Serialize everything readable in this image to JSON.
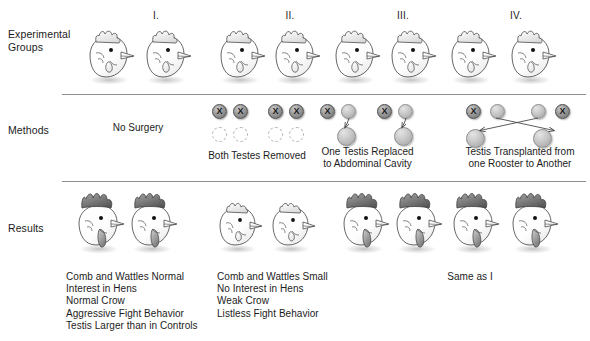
{
  "figure": {
    "background_color": "#ffffff",
    "line_color": "#8d8d8d"
  },
  "row_labels": {
    "experimental_groups": "Experimental\nGroups",
    "methods": "Methods",
    "results": "Results"
  },
  "groups": [
    {
      "numeral": "I.",
      "method_caption": "No Surgery",
      "result_text": "Comb and Wattles Normal\nInterest in Hens\nNormal Crow\nAggressive Fight Behavior\nTestis Larger than in Controls"
    },
    {
      "numeral": "II.",
      "method_caption": "Both Testes Removed",
      "result_text": "Comb and Wattles Small\nNo Interest in Hens\nWeak Crow\nListless Fight Behavior"
    },
    {
      "numeral": "III.",
      "method_caption": "One Testis Replaced\nto Abdominal Cavity",
      "result_text": ""
    },
    {
      "numeral": "IV.",
      "method_caption": "Testis Transplanted from\none Rooster to Another",
      "result_text": "Same as I"
    }
  ],
  "shared_result_note": "Same as I",
  "symbols": {
    "removed_testis_mark": "X",
    "removed_testis_name": "testis-removed-marker",
    "transplanted_testis_name": "testis-transplanted",
    "absent_testis_name": "testis-absent-outline"
  },
  "colors": {
    "text": "#1c1c1c",
    "rule": "#8d8d8d",
    "comb_dark": "#6b6b6b",
    "comb_light": "#e9e9e9",
    "testis_fill": "#c6c6c6"
  }
}
